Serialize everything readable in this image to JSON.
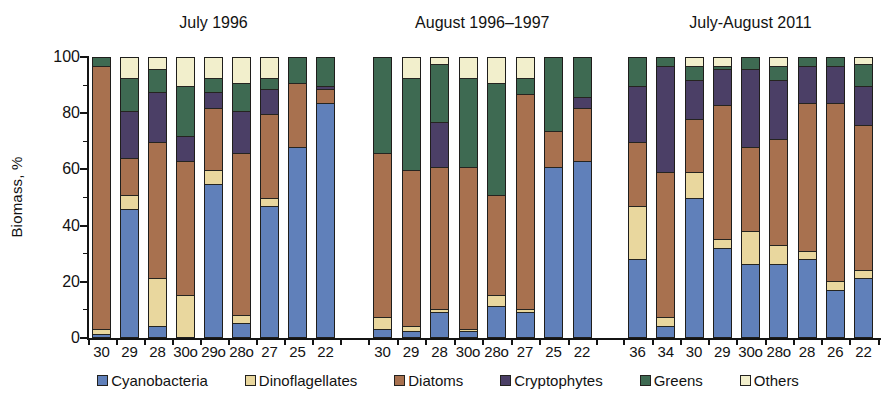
{
  "chart_data": {
    "type": "bar",
    "stacked": true,
    "percent_stacked": true,
    "title": "",
    "xlabel": "",
    "ylabel": "Biomass, %",
    "ylim": [
      0,
      100
    ],
    "yticks_major": [
      0,
      20,
      40,
      60,
      80,
      100
    ],
    "yticks_minor": [
      10,
      30,
      50,
      70,
      90
    ],
    "grid": false,
    "legend_position": "bottom",
    "series_order_bottom_to_top": [
      "Cyanobacteria",
      "Dinoflagellates",
      "Diatoms",
      "Cryptophytes",
      "Greens",
      "Others"
    ],
    "series_colors": {
      "Cyanobacteria": "#6080ba",
      "Dinoflagellates": "#e9d79e",
      "Diatoms": "#a8714f",
      "Cryptophytes": "#4b3f66",
      "Greens": "#3e6a52",
      "Others": "#f2efcc"
    },
    "panels": [
      {
        "title": "July 1996",
        "categories": [
          "30",
          "29",
          "28",
          "30o",
          "29o",
          "28o",
          "27",
          "25",
          "22"
        ],
        "series": [
          {
            "name": "Cyanobacteria",
            "values": [
              1,
              46,
              4,
              0,
              55,
              5,
              47,
              68,
              84
            ]
          },
          {
            "name": "Dinoflagellates",
            "values": [
              2,
              5,
              17,
              15,
              5,
              3,
              3,
              0,
              0
            ]
          },
          {
            "name": "Diatoms",
            "values": [
              94,
              13,
              49,
              48,
              22,
              58,
              30,
              23,
              5
            ]
          },
          {
            "name": "Cryptophytes",
            "values": [
              0,
              17,
              18,
              9,
              6,
              15,
              9,
              0,
              1
            ]
          },
          {
            "name": "Greens",
            "values": [
              3,
              12,
              8,
              18,
              5,
              10,
              4,
              9,
              10
            ]
          },
          {
            "name": "Others",
            "values": [
              0,
              7,
              4,
              10,
              7,
              9,
              7,
              0,
              0
            ]
          }
        ]
      },
      {
        "title": "August 1996–1997",
        "categories": [
          "30",
          "29",
          "28",
          "30o",
          "28o",
          "27",
          "25",
          "22"
        ],
        "series": [
          {
            "name": "Cyanobacteria",
            "values": [
              3,
              2,
              9,
              2,
              11,
              9,
              61,
              63
            ]
          },
          {
            "name": "Dinoflagellates",
            "values": [
              4,
              2,
              1,
              1,
              4,
              1,
              0,
              0
            ]
          },
          {
            "name": "Diatoms",
            "values": [
              59,
              56,
              51,
              58,
              36,
              77,
              13,
              19
            ]
          },
          {
            "name": "Cryptophytes",
            "values": [
              0,
              0,
              16,
              0,
              0,
              0,
              0,
              4
            ]
          },
          {
            "name": "Greens",
            "values": [
              34,
              33,
              21,
              32,
              40,
              6,
              26,
              14
            ]
          },
          {
            "name": "Others",
            "values": [
              0,
              7,
              2,
              7,
              9,
              7,
              0,
              0
            ]
          }
        ]
      },
      {
        "title": "July-August 2011",
        "categories": [
          "36",
          "34",
          "30",
          "29",
          "30o",
          "28o",
          "28",
          "26",
          "22"
        ],
        "series": [
          {
            "name": "Cyanobacteria",
            "values": [
              28,
              4,
              50,
              32,
              26,
              26,
              28,
              17,
              21
            ]
          },
          {
            "name": "Dinoflagellates",
            "values": [
              19,
              3,
              9,
              3,
              12,
              7,
              3,
              3,
              3
            ]
          },
          {
            "name": "Diatoms",
            "values": [
              23,
              52,
              19,
              48,
              30,
              38,
              53,
              64,
              52
            ]
          },
          {
            "name": "Cryptophytes",
            "values": [
              20,
              38,
              14,
              13,
              28,
              21,
              13,
              13,
              14
            ]
          },
          {
            "name": "Greens",
            "values": [
              10,
              3,
              5,
              1,
              4,
              5,
              3,
              3,
              8
            ]
          },
          {
            "name": "Others",
            "values": [
              0,
              0,
              3,
              3,
              0,
              3,
              0,
              0,
              2
            ]
          }
        ]
      }
    ]
  }
}
